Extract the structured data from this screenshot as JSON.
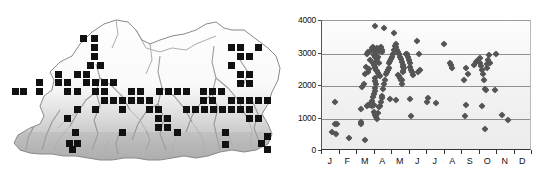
{
  "figure": {
    "panels": [
      "distribution-map",
      "altitude-scatter"
    ]
  },
  "map": {
    "region_name": "Bhutan",
    "symbol": "filled-square",
    "symbol_color": "#111111",
    "terrain_shading": "grayscale-relief",
    "outline_color": "#8a8a8a",
    "records": [
      [
        80,
        35
      ],
      [
        91,
        35
      ],
      [
        91,
        44
      ],
      [
        91,
        53
      ],
      [
        87,
        62
      ],
      [
        97,
        62
      ],
      [
        55,
        71
      ],
      [
        74,
        71
      ],
      [
        83,
        71
      ],
      [
        36,
        79
      ],
      [
        55,
        79
      ],
      [
        64,
        79
      ],
      [
        83,
        79
      ],
      [
        92,
        79
      ],
      [
        101,
        79
      ],
      [
        110,
        79
      ],
      [
        36,
        88
      ],
      [
        64,
        88
      ],
      [
        74,
        88
      ],
      [
        92,
        88
      ],
      [
        101,
        88
      ],
      [
        128,
        88
      ],
      [
        137,
        88
      ],
      [
        156,
        88
      ],
      [
        165,
        88
      ],
      [
        174,
        88
      ],
      [
        183,
        88
      ],
      [
        101,
        97
      ],
      [
        110,
        97
      ],
      [
        119,
        97
      ],
      [
        128,
        97
      ],
      [
        137,
        97
      ],
      [
        146,
        97
      ],
      [
        200,
        88
      ],
      [
        209,
        88
      ],
      [
        218,
        88
      ],
      [
        200,
        97
      ],
      [
        209,
        97
      ],
      [
        228,
        44
      ],
      [
        237,
        44
      ],
      [
        255,
        44
      ],
      [
        237,
        53
      ],
      [
        246,
        53
      ],
      [
        228,
        62
      ],
      [
        237,
        71
      ],
      [
        246,
        71
      ],
      [
        237,
        80
      ],
      [
        246,
        80
      ],
      [
        228,
        97
      ],
      [
        237,
        97
      ],
      [
        246,
        97
      ],
      [
        255,
        97
      ],
      [
        264,
        97
      ],
      [
        74,
        106
      ],
      [
        92,
        106
      ],
      [
        119,
        106
      ],
      [
        146,
        106
      ],
      [
        155,
        106
      ],
      [
        183,
        106
      ],
      [
        192,
        106
      ],
      [
        201,
        106
      ],
      [
        210,
        106
      ],
      [
        219,
        106
      ],
      [
        228,
        106
      ],
      [
        237,
        106
      ],
      [
        246,
        106
      ],
      [
        12,
        88
      ],
      [
        20,
        88
      ],
      [
        64,
        115
      ],
      [
        155,
        115
      ],
      [
        164,
        115
      ],
      [
        255,
        115
      ],
      [
        155,
        124
      ],
      [
        164,
        124
      ],
      [
        246,
        115
      ],
      [
        72,
        129
      ],
      [
        119,
        129
      ],
      [
        174,
        129
      ],
      [
        222,
        129
      ],
      [
        66,
        140
      ],
      [
        74,
        140
      ],
      [
        69,
        146
      ],
      [
        222,
        141
      ],
      [
        258,
        140
      ],
      [
        264,
        146
      ],
      [
        264,
        133
      ]
    ]
  },
  "chart_data": {
    "type": "scatter",
    "title": "",
    "xlabel": "",
    "ylabel": "",
    "xlim": [
      0,
      12
    ],
    "ylim": [
      0,
      4000
    ],
    "ytick_values": [
      0,
      1000,
      2000,
      3000,
      4000
    ],
    "ytick_labels": [
      "0",
      "1000",
      "2000",
      "3000",
      "4000"
    ],
    "xtick_labels": [
      "J",
      "F",
      "M",
      "A",
      "M",
      "J",
      "J",
      "A",
      "S",
      "O",
      "N",
      "D"
    ],
    "grid": "horizontal",
    "legend": "none",
    "marker": "diamond",
    "marker_color": "#555555",
    "series": [
      {
        "name": "records",
        "points": [
          [
            0.55,
            600
          ],
          [
            0.75,
            830
          ],
          [
            0.85,
            820
          ],
          [
            0.8,
            520
          ],
          [
            0.72,
            1500
          ],
          [
            1.55,
            400
          ],
          [
            2.2,
            1280
          ],
          [
            2.25,
            900
          ],
          [
            2.25,
            830
          ],
          [
            2.45,
            340
          ],
          [
            2.3,
            1960
          ],
          [
            2.4,
            2050
          ],
          [
            2.45,
            2380
          ],
          [
            2.5,
            2600
          ],
          [
            2.55,
            2980
          ],
          [
            2.6,
            3050
          ],
          [
            2.55,
            1400
          ],
          [
            2.65,
            1430
          ],
          [
            2.75,
            1420
          ],
          [
            2.85,
            1400
          ],
          [
            2.95,
            1430
          ],
          [
            2.6,
            2420
          ],
          [
            2.7,
            2520
          ],
          [
            2.75,
            2800
          ],
          [
            2.8,
            3080
          ],
          [
            2.85,
            3180
          ],
          [
            2.9,
            3210
          ],
          [
            2.95,
            3150
          ],
          [
            3.0,
            3100
          ],
          [
            2.95,
            2950
          ],
          [
            3.0,
            2890
          ],
          [
            3.05,
            3120
          ],
          [
            3.1,
            3050
          ],
          [
            3.0,
            3850
          ],
          [
            3.15,
            3180
          ],
          [
            3.2,
            3130
          ],
          [
            3.25,
            3080
          ],
          [
            3.3,
            3160
          ],
          [
            3.35,
            3210
          ],
          [
            3.4,
            3100
          ],
          [
            3.45,
            3050
          ],
          [
            2.9,
            2700
          ],
          [
            2.95,
            2650
          ],
          [
            3.0,
            2600
          ],
          [
            3.05,
            2550
          ],
          [
            3.1,
            2500
          ],
          [
            3.15,
            2450
          ],
          [
            3.2,
            2400
          ],
          [
            3.25,
            2350
          ],
          [
            3.3,
            2300
          ],
          [
            3.1,
            2750
          ],
          [
            3.15,
            2820
          ],
          [
            3.2,
            2880
          ],
          [
            3.25,
            2720
          ],
          [
            3.0,
            2250
          ],
          [
            3.05,
            2150
          ],
          [
            3.1,
            2050
          ],
          [
            3.05,
            1950
          ],
          [
            3.0,
            1850
          ],
          [
            2.95,
            1750
          ],
          [
            2.9,
            1650
          ],
          [
            2.85,
            1550
          ],
          [
            2.8,
            1480
          ],
          [
            2.95,
            1200
          ],
          [
            3.0,
            1150
          ],
          [
            3.05,
            1100
          ],
          [
            3.1,
            1050
          ],
          [
            3.15,
            1000
          ],
          [
            3.2,
            1180
          ],
          [
            3.25,
            1350
          ],
          [
            3.3,
            1400
          ],
          [
            3.35,
            1500
          ],
          [
            3.4,
            1620
          ],
          [
            3.45,
            1700
          ],
          [
            3.5,
            1900
          ],
          [
            3.55,
            2050
          ],
          [
            3.6,
            2200
          ],
          [
            3.65,
            2380
          ],
          [
            3.55,
            3780
          ],
          [
            3.7,
            2420
          ],
          [
            3.75,
            2480
          ],
          [
            3.8,
            2550
          ],
          [
            3.85,
            2700
          ],
          [
            3.9,
            2760
          ],
          [
            3.95,
            2820
          ],
          [
            4.0,
            2900
          ],
          [
            4.05,
            3000
          ],
          [
            4.1,
            3120
          ],
          [
            4.15,
            3230
          ],
          [
            4.2,
            3280
          ],
          [
            4.25,
            3200
          ],
          [
            4.3,
            3120
          ],
          [
            4.35,
            3050
          ],
          [
            4.4,
            2980
          ],
          [
            4.45,
            2900
          ],
          [
            4.1,
            3620
          ],
          [
            4.5,
            2820
          ],
          [
            4.55,
            2750
          ],
          [
            4.6,
            2650
          ],
          [
            4.65,
            2600
          ],
          [
            4.7,
            2550
          ],
          [
            4.35,
            2350
          ],
          [
            4.4,
            2300
          ],
          [
            4.45,
            2250
          ],
          [
            4.5,
            2200
          ],
          [
            4.55,
            2180
          ],
          [
            4.6,
            2420
          ],
          [
            4.65,
            2470
          ],
          [
            3.9,
            1600
          ],
          [
            4.2,
            1580
          ],
          [
            4.55,
            2050
          ],
          [
            4.8,
            2980
          ],
          [
            4.85,
            3000
          ],
          [
            4.9,
            2900
          ],
          [
            4.95,
            2800
          ],
          [
            5.0,
            2700
          ],
          [
            5.05,
            2600
          ],
          [
            5.1,
            2500
          ],
          [
            5.15,
            2420
          ],
          [
            5.2,
            2350
          ],
          [
            5.0,
            1600
          ],
          [
            5.1,
            1080
          ],
          [
            5.45,
            3380
          ],
          [
            5.55,
            3000
          ],
          [
            5.6,
            2480
          ],
          [
            5.5,
            2420
          ],
          [
            6.0,
            1520
          ],
          [
            6.05,
            1620
          ],
          [
            6.5,
            1480
          ],
          [
            6.95,
            3280
          ],
          [
            7.3,
            2700
          ],
          [
            7.35,
            2650
          ],
          [
            7.4,
            2560
          ],
          [
            8.2,
            2560
          ],
          [
            8.1,
            2180
          ],
          [
            8.25,
            1420
          ],
          [
            8.15,
            1080
          ],
          [
            8.35,
            2380
          ],
          [
            8.7,
            2650
          ],
          [
            8.8,
            2750
          ],
          [
            8.9,
            2800
          ],
          [
            9.0,
            2850
          ],
          [
            9.05,
            2700
          ],
          [
            9.1,
            2620
          ],
          [
            9.15,
            2480
          ],
          [
            9.2,
            2380
          ],
          [
            9.25,
            2200
          ],
          [
            9.3,
            1920
          ],
          [
            9.35,
            1880
          ],
          [
            9.4,
            2550
          ],
          [
            9.45,
            2680
          ],
          [
            9.5,
            2800
          ],
          [
            9.55,
            2950
          ],
          [
            9.6,
            2700
          ],
          [
            9.15,
            1370
          ],
          [
            9.3,
            680
          ],
          [
            9.95,
            2980
          ],
          [
            10.3,
            1100
          ],
          [
            10.65,
            960
          ],
          [
            9.9,
            1880
          ]
        ]
      }
    ]
  }
}
